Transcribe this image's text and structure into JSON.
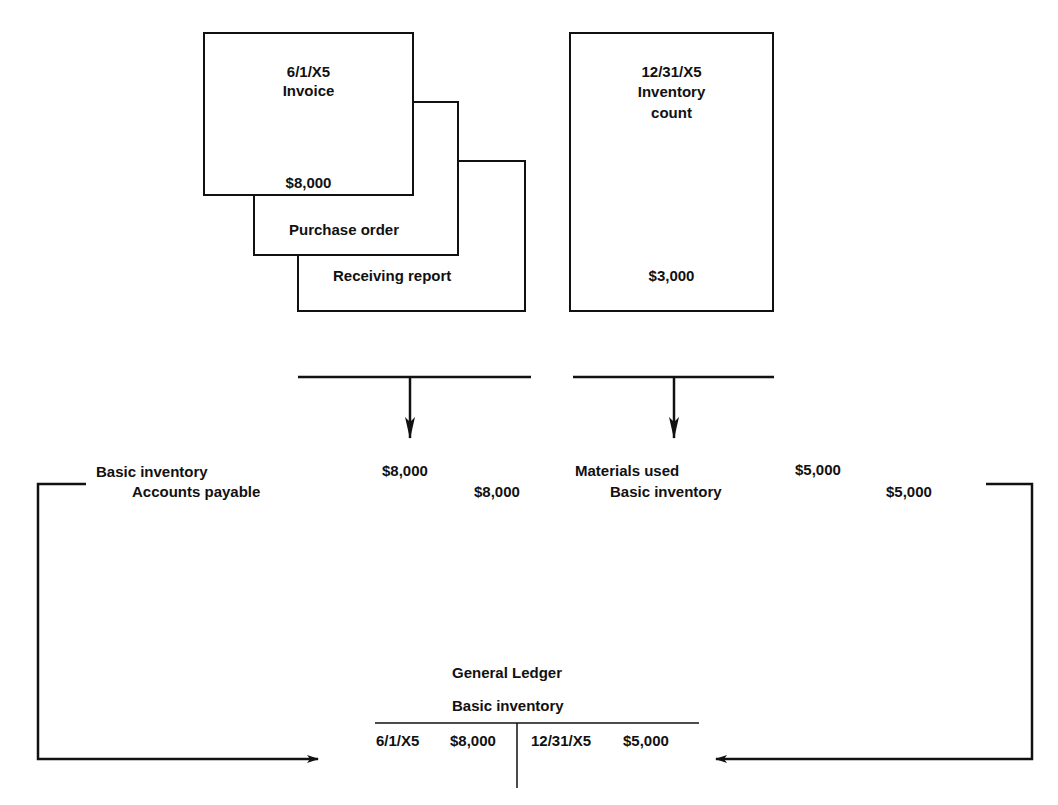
{
  "documents": {
    "invoice": {
      "date": "6/1/X5",
      "title": "Invoice",
      "amount": "$8,000"
    },
    "purchase_order": {
      "title": "Purchase order"
    },
    "receiving_report": {
      "title": "Receiving report"
    },
    "inventory_count": {
      "date": "12/31/X5",
      "title_line1": "Inventory",
      "title_line2": "count",
      "amount": "$3,000"
    }
  },
  "journal_entries": {
    "purchase": {
      "debit_account": "Basic inventory",
      "debit_amount": "$8,000",
      "credit_account": "Accounts payable",
      "credit_amount": "$8,000"
    },
    "usage": {
      "debit_account": "Materials used",
      "debit_amount": "$5,000",
      "credit_account": "Basic inventory",
      "credit_amount": "$5,000"
    }
  },
  "ledger": {
    "title": "General Ledger",
    "account": "Basic inventory",
    "debit": {
      "date": "6/1/X5",
      "amount": "$8,000"
    },
    "credit": {
      "date": "12/31/X5",
      "amount": "$5,000"
    }
  },
  "colors": {
    "ink": "#111111",
    "background": "#ffffff"
  }
}
